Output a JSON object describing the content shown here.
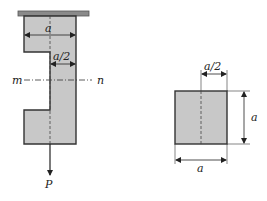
{
  "diagram": {
    "left_figure": {
      "labels": {
        "width_top": "a",
        "width_narrow": "a/2",
        "section_left": "m",
        "section_right": "n",
        "load": "P"
      }
    },
    "right_figure": {
      "labels": {
        "offset_top": "a/2",
        "height_right": "a",
        "width_bottom": "a"
      }
    },
    "colors": {
      "fill": "#c8c8c8",
      "stroke": "#333333",
      "ceiling": "#8a8a8a"
    }
  }
}
